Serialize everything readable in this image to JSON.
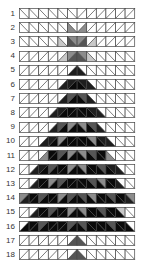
{
  "diagram": {
    "columns": 12,
    "shades": {
      "W": "#ffffff",
      "L": "#c8c8c8",
      "G": "#8c8c8c",
      "M": "#555555",
      "D": "#1e1e1e",
      "K": "#0a0a0a"
    },
    "grid_color": "#444444",
    "rows": [
      {
        "label": "1",
        "cells": [
          "\\WW",
          "\\WW",
          "\\WW",
          "\\WW",
          "\\WW",
          "\\WW",
          "/WW",
          "/WW",
          "/WW",
          "/WW",
          "/WW",
          "/WW"
        ]
      },
      {
        "label": "2",
        "cells": [
          "\\WW",
          "\\WW",
          "\\WW",
          "\\WW",
          "\\WW",
          "\\WG",
          "/WG",
          "/WW",
          "/WW",
          "/WW",
          "/WW",
          "/WW"
        ]
      },
      {
        "label": "3",
        "cells": [
          "\\WW",
          "\\WW",
          "\\WW",
          "\\WW",
          "\\WL",
          "\\GM",
          "/GM",
          "/WL",
          "/WW",
          "/WW",
          "/WW",
          "/WW"
        ]
      },
      {
        "label": "4",
        "cells": [
          "/WW",
          "/WW",
          "/WW",
          "/WW",
          "/WL",
          "/GM",
          "\\GM",
          "\\WL",
          "\\WW",
          "\\WW",
          "\\WW",
          "\\WW"
        ]
      },
      {
        "label": "5",
        "cells": [
          "/WW",
          "/WW",
          "/WW",
          "/WW",
          "/WW",
          "/WD",
          "\\WD",
          "\\WW",
          "\\WW",
          "\\WW",
          "\\WW",
          "\\WW"
        ]
      },
      {
        "label": "6",
        "cells": [
          "/WW",
          "/WW",
          "/WW",
          "/WW",
          "/WD",
          "/DK",
          "\\DK",
          "\\WD",
          "\\WW",
          "\\WW",
          "\\WW",
          "\\WW"
        ]
      },
      {
        "label": "7",
        "cells": [
          "/WW",
          "/WW",
          "/WW",
          "/WW",
          "/WD",
          "/MK",
          "\\MK",
          "\\WD",
          "\\WW",
          "\\WW",
          "\\WW",
          "\\WW"
        ]
      },
      {
        "label": "8",
        "cells": [
          "/WW",
          "/WW",
          "/WW",
          "/WD",
          "/DK",
          "/KK",
          "\\KK",
          "\\DK",
          "\\WD",
          "\\WW",
          "\\WW",
          "\\WW"
        ]
      },
      {
        "label": "9",
        "cells": [
          "/WW",
          "/WW",
          "/WW",
          "/WD",
          "/MK",
          "/GK",
          "\\GK",
          "\\MK",
          "\\WD",
          "\\WW",
          "\\WW",
          "\\WW"
        ]
      },
      {
        "label": "10",
        "cells": [
          "/WW",
          "/WW",
          "/WD",
          "/DK",
          "/GK",
          "/KK",
          "\\KK",
          "\\GK",
          "\\DK",
          "\\WD",
          "\\WW",
          "\\WW"
        ]
      },
      {
        "label": "11",
        "cells": [
          "/WW",
          "/WW",
          "/WG",
          "/KK",
          "/MK",
          "/GK",
          "\\GK",
          "\\MK",
          "\\KK",
          "\\WG",
          "\\WW",
          "\\WW"
        ]
      },
      {
        "label": "12",
        "cells": [
          "/WW",
          "/WD",
          "/DK",
          "/MK",
          "/KK",
          "/GK",
          "\\GK",
          "\\KK",
          "\\MK",
          "\\DK",
          "\\WD",
          "\\WW"
        ]
      },
      {
        "label": "13",
        "cells": [
          "/WW",
          "/WD",
          "/KK",
          "/GK",
          "/MK",
          "/KK",
          "\\KK",
          "\\MK",
          "\\GK",
          "\\KK",
          "\\WD",
          "\\WW"
        ]
      },
      {
        "label": "14",
        "cells": [
          "/GD",
          "/KK",
          "/MK",
          "/KK",
          "/GK",
          "/MK",
          "\\MK",
          "\\GK",
          "\\KK",
          "\\MK",
          "\\KK",
          "\\GD"
        ]
      },
      {
        "label": "15",
        "cells": [
          "/WW",
          "/WD",
          "/KK",
          "/MK",
          "/KK",
          "/GK",
          "\\GK",
          "\\KK",
          "\\MK",
          "\\KK",
          "\\LK",
          "\\WW"
        ]
      },
      {
        "label": "16",
        "cells": [
          "/WK",
          "/KK",
          "/MK",
          "/KK",
          "/KK",
          "/MK",
          "\\MK",
          "\\KK",
          "\\KK",
          "\\MK",
          "\\KK",
          "\\WK"
        ]
      },
      {
        "label": "17",
        "cells": [
          "/WW",
          "/WW",
          "/WW",
          "/WW",
          "/WW",
          "/WM",
          "\\WM",
          "\\WW",
          "\\WW",
          "\\WW",
          "\\WW",
          "\\WW"
        ]
      },
      {
        "label": "18",
        "cells": [
          "/WW",
          "/WW",
          "/WW",
          "/WW",
          "/WW",
          "/WM",
          "\\WM",
          "\\WW",
          "\\WW",
          "\\WW",
          "\\WW",
          "\\WW"
        ]
      }
    ]
  }
}
